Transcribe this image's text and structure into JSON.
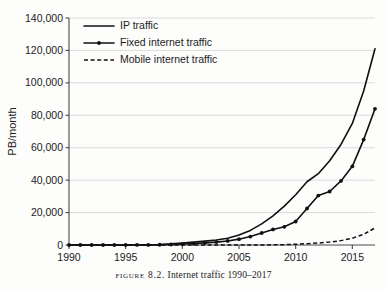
{
  "figure": {
    "caption_prefix": "Figure 8.2.",
    "caption_text": "Internet traffic 1990–2017",
    "background_color": "#fdfdfc",
    "ink_color": "#101010",
    "grid_color": "#d2d2d2"
  },
  "chart_data": {
    "type": "line",
    "title": "",
    "subtitle": "",
    "xlabel": "",
    "ylabel": "PB/month",
    "xlim": [
      1990,
      2017
    ],
    "ylim": [
      0,
      140000
    ],
    "grid": "horizontal",
    "legend_position": "top-left",
    "x_ticks": [
      1990,
      1995,
      2000,
      2005,
      2010,
      2015
    ],
    "x_tick_labels": [
      "1990",
      "1995",
      "2000",
      "2005",
      "2010",
      "2015"
    ],
    "y_ticks": [
      0,
      20000,
      40000,
      60000,
      80000,
      100000,
      120000,
      140000
    ],
    "y_tick_labels": [
      "0",
      "20,000",
      "40,000",
      "60,000",
      "80,000",
      "100,000",
      "120,000",
      "140,000"
    ],
    "x": [
      1990,
      1991,
      1992,
      1993,
      1994,
      1995,
      1996,
      1997,
      1998,
      1999,
      2000,
      2001,
      2002,
      2003,
      2004,
      2005,
      2006,
      2007,
      2008,
      2009,
      2010,
      2011,
      2012,
      2013,
      2014,
      2015,
      2016,
      2017
    ],
    "series": [
      {
        "name": "IP traffic",
        "style": "solid",
        "markers": false,
        "values": [
          1,
          2,
          4,
          8,
          16,
          35,
          80,
          170,
          350,
          700,
          1200,
          1800,
          2400,
          3100,
          4200,
          6200,
          9000,
          13000,
          18000,
          24000,
          31000,
          39000,
          44000,
          52000,
          62000,
          75000,
          95000,
          121000
        ]
      },
      {
        "name": "Fixed internet traffic",
        "style": "solid",
        "markers": true,
        "values": [
          0,
          0,
          1,
          2,
          5,
          12,
          30,
          70,
          150,
          320,
          600,
          900,
          1300,
          1800,
          2500,
          3600,
          5200,
          7400,
          9600,
          11200,
          14500,
          22500,
          30500,
          33000,
          39500,
          48500,
          65000,
          84000
        ]
      },
      {
        "name": "Mobile internet traffic",
        "style": "dashed",
        "markers": false,
        "values": [
          0,
          0,
          0,
          0,
          0,
          0,
          0,
          0,
          0,
          0,
          0,
          0,
          0,
          0,
          0,
          0,
          10,
          30,
          90,
          220,
          450,
          800,
          1200,
          1800,
          2700,
          4200,
          6600,
          10500
        ]
      }
    ]
  },
  "legend": {
    "items": [
      {
        "label": "IP traffic",
        "style": "solid",
        "marker": false
      },
      {
        "label": "Fixed internet traffic",
        "style": "solid",
        "marker": true
      },
      {
        "label": "Mobile internet traffic",
        "style": "dashed",
        "marker": false
      }
    ]
  }
}
